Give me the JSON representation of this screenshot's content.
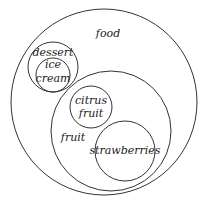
{
  "diagram": {
    "type": "euler",
    "sets": [
      {
        "id": "food",
        "label": "food"
      },
      {
        "id": "dessert",
        "label": "dessert",
        "parent": "food"
      },
      {
        "id": "ice_cream",
        "label_lines": [
          "ice",
          "cream"
        ],
        "parent": "dessert"
      },
      {
        "id": "fruit",
        "label": "fruit",
        "parent": "food"
      },
      {
        "id": "citrus",
        "label_lines": [
          "citrus",
          "fruit"
        ],
        "parent": "fruit"
      },
      {
        "id": "strawberries",
        "label": "strawberries",
        "parent": "fruit"
      }
    ]
  },
  "labels": {
    "food": "food",
    "dessert": "dessert",
    "ice": "ice",
    "cream": "cream",
    "fruit": "fruit",
    "citrus": "citrus",
    "citrus_fruit": "fruit",
    "strawberries": "strawberries"
  }
}
